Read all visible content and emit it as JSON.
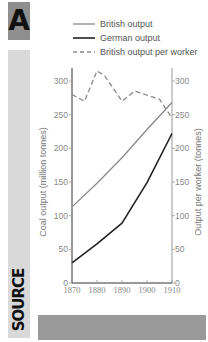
{
  "panel": {
    "letter": "A",
    "source_label": "SOURCE"
  },
  "legend": [
    {
      "label": "British output",
      "style": "solid",
      "color": "#8a8a8a"
    },
    {
      "label": "German output",
      "style": "solid",
      "color": "#222222"
    },
    {
      "label": "British output per worker",
      "style": "dashed",
      "color": "#8a8a8a"
    }
  ],
  "axes": {
    "left_title": "Coal output (million tonnes)",
    "right_title": "Output per worker (tonnes)",
    "y_ticks": [
      "0",
      "50",
      "100",
      "150",
      "200",
      "250",
      "300"
    ],
    "x_ticks": [
      "1870",
      "1880",
      "1890",
      "1900",
      "1910"
    ]
  },
  "chart_data": {
    "type": "line",
    "title": "",
    "xlabel": "",
    "ylabel": "Coal output (million tonnes)",
    "ylabel_right": "Output per worker (tonnes)",
    "xlim": [
      1870,
      1910
    ],
    "ylim": [
      0,
      320
    ],
    "ylim_right": [
      0,
      320
    ],
    "grid": false,
    "legend_position": "top",
    "x_ticks": [
      1870,
      1880,
      1890,
      1900,
      1910
    ],
    "y_ticks": [
      0,
      50,
      100,
      150,
      200,
      250,
      300
    ],
    "series": [
      {
        "name": "British output",
        "axis": "left",
        "style": "solid",
        "x": [
          1870,
          1880,
          1890,
          1900,
          1910
        ],
        "values": [
          113,
          148,
          186,
          228,
          268
        ]
      },
      {
        "name": "German output",
        "axis": "left",
        "style": "solid",
        "x": [
          1870,
          1880,
          1890,
          1900,
          1910
        ],
        "values": [
          30,
          58,
          89,
          149,
          222
        ]
      },
      {
        "name": "British output per worker",
        "axis": "right",
        "style": "dashed",
        "x": [
          1870,
          1875,
          1880,
          1883,
          1890,
          1895,
          1905,
          1910
        ],
        "values": [
          280,
          270,
          315,
          308,
          270,
          285,
          273,
          245
        ]
      }
    ]
  }
}
